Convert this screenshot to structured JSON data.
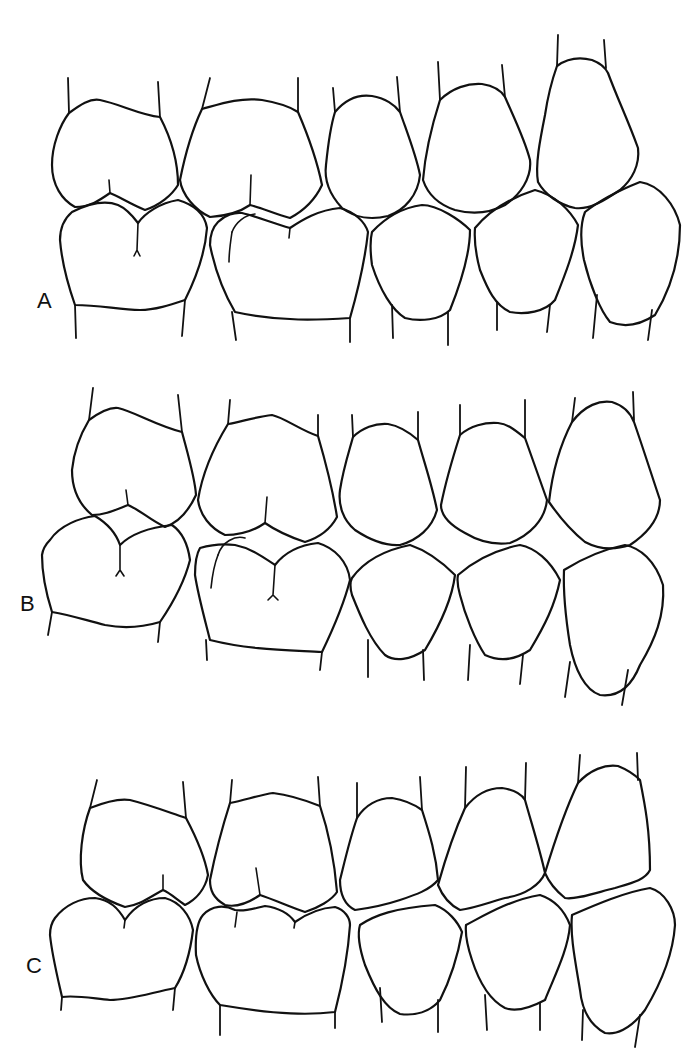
{
  "figure": {
    "panels": [
      {
        "label": "A",
        "upper_teeth": 5,
        "lower_teeth": 5
      },
      {
        "label": "B",
        "upper_teeth": 5,
        "lower_teeth": 5
      },
      {
        "label": "C",
        "upper_teeth": 5,
        "lower_teeth": 5
      }
    ]
  },
  "colors": {
    "stroke": "#111111",
    "background": "#ffffff"
  }
}
